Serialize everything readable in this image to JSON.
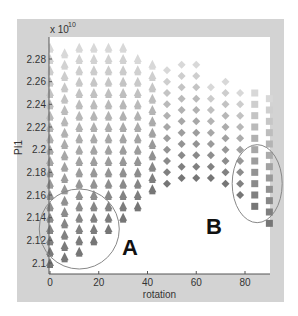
{
  "chart_data": {
    "type": "scatter",
    "title": "",
    "xlabel": "rotation",
    "ylabel": "PI1",
    "y_multiplier_label": "x 10",
    "y_multiplier_exponent": "10",
    "xlim": [
      0,
      90
    ],
    "ylim": [
      2.09,
      2.3
    ],
    "xticks": [
      0,
      20,
      40,
      60,
      80
    ],
    "xtick_labels": [
      "0",
      "20",
      "40",
      "60",
      "80"
    ],
    "yticks": [
      2.1,
      2.12,
      2.14,
      2.16,
      2.18,
      2.2,
      2.22,
      2.24,
      2.26,
      2.28
    ],
    "ytick_labels": [
      "2.1",
      "2.12",
      "2.14",
      "2.16",
      "2.18",
      "2.2",
      "2.22",
      "2.24",
      "2.26",
      "2.28"
    ],
    "grid": false,
    "marker_colors": {
      "light": "#e6e6e6",
      "dark": "#6e6e6e"
    },
    "columns": [
      {
        "rotation": 0,
        "marker": "triangle",
        "min": 2.1,
        "max": 2.285
      },
      {
        "rotation": 6,
        "marker": "triangle",
        "min": 2.105,
        "max": 2.285
      },
      {
        "rotation": 12,
        "marker": "triangle",
        "min": 2.11,
        "max": 2.29
      },
      {
        "rotation": 18,
        "marker": "triangle",
        "min": 2.12,
        "max": 2.285
      },
      {
        "rotation": 24,
        "marker": "triangle",
        "min": 2.13,
        "max": 2.285
      },
      {
        "rotation": 30,
        "marker": "triangle",
        "min": 2.14,
        "max": 2.285
      },
      {
        "rotation": 36,
        "marker": "triangle",
        "min": 2.15,
        "max": 2.275
      },
      {
        "rotation": 42,
        "marker": "triangle",
        "min": 2.165,
        "max": 2.28
      },
      {
        "rotation": 48,
        "marker": "diamond",
        "min": 2.17,
        "max": 2.27
      },
      {
        "rotation": 54,
        "marker": "diamond",
        "min": 2.175,
        "max": 2.27
      },
      {
        "rotation": 60,
        "marker": "diamond",
        "min": 2.175,
        "max": 2.27
      },
      {
        "rotation": 66,
        "marker": "diamond",
        "min": 2.175,
        "max": 2.26
      },
      {
        "rotation": 72,
        "marker": "diamond",
        "min": 2.17,
        "max": 2.26
      },
      {
        "rotation": 78,
        "marker": "diamond",
        "min": 2.16,
        "max": 2.25
      },
      {
        "rotation": 84,
        "marker": "square",
        "min": 2.15,
        "max": 2.25
      },
      {
        "rotation": 90,
        "marker": "square",
        "min": 2.135,
        "max": 2.24
      }
    ],
    "point_spacing": 0.01,
    "annotations": [
      {
        "label": "A",
        "shape": "circle",
        "x": 12,
        "y": 2.13
      },
      {
        "label": "B",
        "shape": "ellipse",
        "x": 85,
        "y": 2.17
      }
    ]
  }
}
